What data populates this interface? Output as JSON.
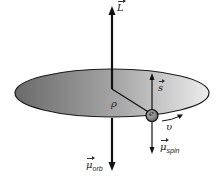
{
  "diagram": {
    "type": "orbital-and-spin-angular-momentum",
    "labels": {
      "L": "L",
      "s": "s",
      "rho": "ρ",
      "electron": "e",
      "velocity": "υ",
      "mu": "μ",
      "mu_orb_sub": "orb",
      "mu_spin_sub": "spin"
    },
    "colors": {
      "disk_dark": "#6e6e6e",
      "disk_light": "#e8e8e8",
      "lines": "#1a1a1a",
      "electron_fill": "#8a8a8a"
    }
  }
}
